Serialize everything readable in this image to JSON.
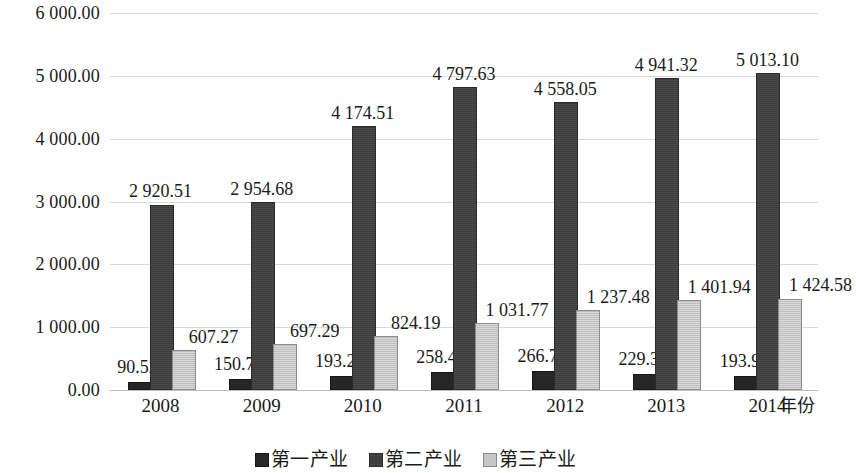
{
  "chart_data": {
    "type": "bar",
    "title": "",
    "subtitle": "",
    "xlabel": "年份",
    "ylabel": "",
    "categories": [
      "2008",
      "2009",
      "2010",
      "2011",
      "2012",
      "2013",
      "2014"
    ],
    "series": [
      {
        "name": "第一产业",
        "color": "#262626",
        "values": [
          90.52,
          150.76,
          193.24,
          258.41,
          266.74,
          229.3,
          193.91
        ],
        "labels": [
          "90.52",
          "150.76",
          "193.24",
          "258.41",
          "266.74",
          "229.30",
          "193.91"
        ]
      },
      {
        "name": "第二产业",
        "color": "#3f3f3f",
        "values": [
          2920.51,
          2954.68,
          4174.51,
          4797.63,
          4558.05,
          4941.32,
          5013.1
        ],
        "labels": [
          "2 920.51",
          "2 954.68",
          "4 174.51",
          "4 797.63",
          "4 558.05",
          "4 941.32",
          "5 013.10"
        ]
      },
      {
        "name": "第三产业",
        "color": "#c6c6c6",
        "values": [
          607.27,
          697.29,
          824.19,
          1031.77,
          1237.48,
          1401.94,
          1424.58
        ],
        "labels": [
          "607.27",
          "697.29",
          "824.19",
          "1 031.77",
          "1 237.48",
          "1 401.94",
          "1 424.58"
        ]
      }
    ],
    "ylim": [
      0,
      6000
    ],
    "ytick_values": [
      0,
      1000,
      2000,
      3000,
      4000,
      5000,
      6000
    ],
    "ytick_labels": [
      "0.00",
      "1 000.00",
      "2 000.00",
      "3 000.00",
      "4 000.00",
      "5 000.00",
      "6 000.00"
    ],
    "grid": true,
    "legend_position": "bottom",
    "data_labels_shown": true,
    "gridline_color": "#d9d9d9",
    "background_color": "#ffffff"
  }
}
